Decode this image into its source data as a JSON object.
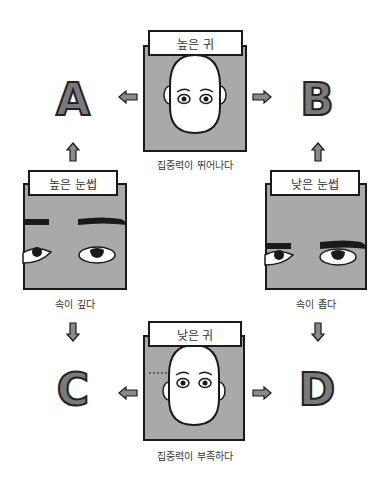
{
  "diagram": {
    "top": {
      "label": "높은 귀",
      "caption": "집중력이 뛰어나다"
    },
    "left": {
      "label": "높은 눈썹",
      "caption": "속이 깊다"
    },
    "right": {
      "label": "낮은 눈썹",
      "caption": "속이 좁다"
    },
    "bottom": {
      "label": "낮은 귀",
      "caption": "집중력이 부족하다"
    },
    "outcomes": {
      "a": "A",
      "b": "B",
      "c": "C",
      "d": "D"
    },
    "colors": {
      "panel": "#a9a9a9",
      "outline": "#1a1a1a",
      "letter_fill": "#7a7a7a",
      "arrow_fill": "#8a8a8a"
    }
  }
}
